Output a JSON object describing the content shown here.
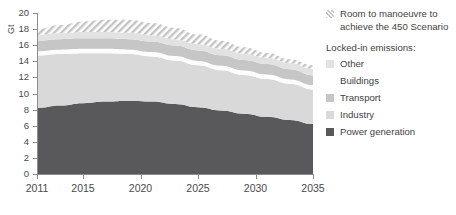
{
  "chart_data": {
    "type": "area",
    "title": "",
    "xlabel": "",
    "ylabel": "Gt",
    "xlim": [
      2011,
      2035
    ],
    "ylim": [
      0,
      20
    ],
    "ytick_step": 2,
    "grid": true,
    "legend_position": "right",
    "x": [
      2011,
      2015,
      2020,
      2025,
      2030,
      2035
    ],
    "x_ticks": [
      "2011",
      "2015",
      "2020",
      "2025",
      "2030",
      "2035"
    ],
    "y_ticks": [
      "0",
      "2",
      "4",
      "6",
      "8",
      "10",
      "12",
      "14",
      "16",
      "18",
      "20"
    ],
    "stacking": "stacked",
    "series": [
      {
        "name": "Power generation",
        "color": "#59595b",
        "x": [
          2011,
          2013,
          2015,
          2017,
          2019,
          2021,
          2023,
          2025,
          2027,
          2029,
          2031,
          2033,
          2035
        ],
        "values": [
          8.2,
          8.5,
          8.8,
          9.0,
          9.1,
          9.0,
          8.7,
          8.3,
          7.9,
          7.5,
          7.1,
          6.7,
          6.2
        ]
      },
      {
        "name": "Industry",
        "color": "#d9d9d9",
        "x": [
          2011,
          2013,
          2015,
          2017,
          2019,
          2021,
          2023,
          2025,
          2027,
          2029,
          2031,
          2033,
          2035
        ],
        "values": [
          6.5,
          6.4,
          6.2,
          6.0,
          5.8,
          5.6,
          5.4,
          5.2,
          5.0,
          4.8,
          4.7,
          4.5,
          4.3
        ]
      },
      {
        "name": "Buildings",
        "color": "#fcfcfc",
        "x": [
          2011,
          2013,
          2015,
          2017,
          2019,
          2021,
          2023,
          2025,
          2027,
          2029,
          2031,
          2033,
          2035
        ],
        "values": [
          0.55,
          0.55,
          0.55,
          0.55,
          0.55,
          0.55,
          0.55,
          0.55,
          0.55,
          0.55,
          0.55,
          0.55,
          0.55
        ]
      },
      {
        "name": "Transport",
        "color": "#c6c6c6",
        "x": [
          2011,
          2013,
          2015,
          2017,
          2019,
          2021,
          2023,
          2025,
          2027,
          2029,
          2031,
          2033,
          2035
        ],
        "values": [
          1.3,
          1.3,
          1.3,
          1.3,
          1.3,
          1.3,
          1.3,
          1.3,
          1.3,
          1.3,
          1.3,
          1.25,
          1.2
        ],
        "note": "thin white separator line drawn above the Buildings sliver"
      },
      {
        "name": "Other",
        "color": "#e2e2e2",
        "x": [
          2011,
          2013,
          2015,
          2017,
          2019,
          2021,
          2023,
          2025,
          2027,
          2029,
          2031,
          2033,
          2035
        ],
        "values": [
          0.75,
          0.75,
          0.8,
          0.8,
          0.8,
          0.8,
          0.8,
          0.8,
          0.8,
          0.8,
          0.8,
          0.8,
          0.8
        ]
      },
      {
        "name": "Room to manoeuvre to achieve the 450 Scenario",
        "color": "#cccccc",
        "pattern": "diagonal-hatch",
        "x": [
          2011,
          2013,
          2015,
          2017,
          2019,
          2021,
          2023,
          2025,
          2027,
          2029,
          2031,
          2033,
          2035
        ],
        "values": [
          0.7,
          1.0,
          1.3,
          1.5,
          1.6,
          1.5,
          1.4,
          1.2,
          1.0,
          0.8,
          0.6,
          0.45,
          0.45
        ]
      }
    ],
    "totals": {
      "label": "stacked top of all bands (Gt)",
      "x": [
        2011,
        2013,
        2015,
        2017,
        2019,
        2021,
        2023,
        2025,
        2027,
        2029,
        2031,
        2033,
        2035
      ],
      "values": [
        18.0,
        18.5,
        18.95,
        19.15,
        19.15,
        18.75,
        18.15,
        17.35,
        16.55,
        15.75,
        15.05,
        14.25,
        13.5
      ]
    }
  },
  "legend": {
    "hatch_entry": {
      "label_line1": "Room to manoeuvre to",
      "label_line2": "achieve the 450 Scenario",
      "swatch": "hatch-swatch"
    },
    "heading": "Locked-in emissions:",
    "items": [
      {
        "label": "Other",
        "color": "#e2e2e2"
      },
      {
        "label": "Buildings",
        "color": "#ffffff"
      },
      {
        "label": "Transport",
        "color": "#c6c6c6"
      },
      {
        "label": "Industry",
        "color": "#d9d9d9"
      },
      {
        "label": "Power generation",
        "color": "#59595b"
      }
    ]
  }
}
